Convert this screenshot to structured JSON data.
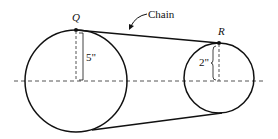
{
  "diagram": {
    "type": "chain-and-sprocket",
    "labels": {
      "point_q": "Q",
      "point_r": "R",
      "chain": "Chain",
      "large_radius": "5\"",
      "small_radius": "2\""
    },
    "colors": {
      "stroke": "#111111",
      "dashed": "#555555",
      "background": "#ffffff"
    },
    "geometry": {
      "large_circle": {
        "cx": 76,
        "cy": 81,
        "r": 51
      },
      "small_circle": {
        "cx": 219,
        "cy": 78,
        "r": 35
      },
      "axis_y": 81
    }
  }
}
